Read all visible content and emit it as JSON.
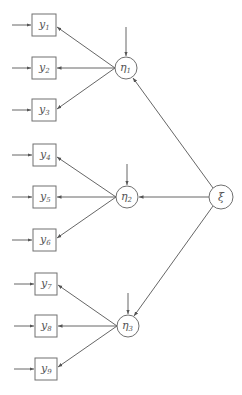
{
  "diagram": {
    "type": "structural-equation-model",
    "colors": {
      "stroke": "#707070",
      "edge": "#555555",
      "text": "#555555",
      "background": "#ffffff"
    },
    "exogenous": {
      "id": "xi",
      "label": "ξ"
    },
    "latent": [
      {
        "id": "eta1",
        "label": "η",
        "sub": "1"
      },
      {
        "id": "eta2",
        "label": "η",
        "sub": "2"
      },
      {
        "id": "eta3",
        "label": "η",
        "sub": "3"
      }
    ],
    "observed": [
      {
        "id": "y1",
        "label": "y",
        "sub": "1",
        "factor": "eta1"
      },
      {
        "id": "y2",
        "label": "y",
        "sub": "2",
        "factor": "eta1"
      },
      {
        "id": "y3",
        "label": "y",
        "sub": "3",
        "factor": "eta1"
      },
      {
        "id": "y4",
        "label": "y",
        "sub": "4",
        "factor": "eta2"
      },
      {
        "id": "y5",
        "label": "y",
        "sub": "5",
        "factor": "eta2"
      },
      {
        "id": "y6",
        "label": "y",
        "sub": "6",
        "factor": "eta2"
      },
      {
        "id": "y7",
        "label": "y",
        "sub": "7",
        "factor": "eta3"
      },
      {
        "id": "y8",
        "label": "y",
        "sub": "8",
        "factor": "eta3"
      },
      {
        "id": "y9",
        "label": "y",
        "sub": "9",
        "factor": "eta3"
      }
    ]
  }
}
